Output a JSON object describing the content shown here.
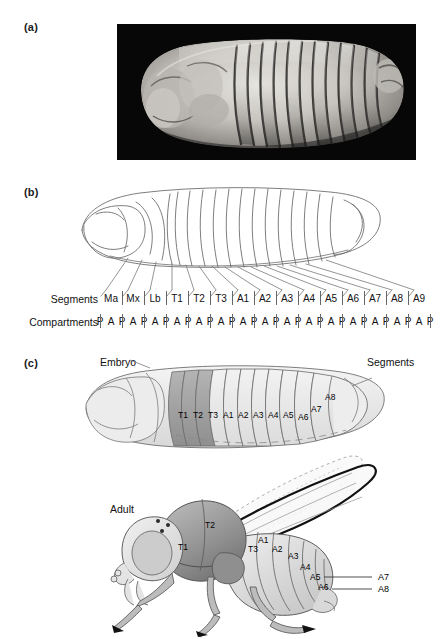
{
  "figure": {
    "panels": [
      {
        "id": "a",
        "label": "(a)",
        "kind": "micrograph",
        "caption_text": ""
      },
      {
        "id": "b",
        "label": "(b)",
        "kind": "line-diagram",
        "caption_text": ""
      },
      {
        "id": "c",
        "label": "(c)",
        "kind": "shaded-diagram",
        "caption_text": ""
      }
    ]
  },
  "panel_a": {
    "label": "(a)",
    "image_name": "drosophila-embryo-scanning-electron-micrograph"
  },
  "panel_b": {
    "label": "(b)",
    "diagram_name": "segmented-embryo-line-drawing",
    "row_labels": {
      "segments": "Segments",
      "compartments": "Compartments"
    },
    "segments": [
      "Ma",
      "Mx",
      "Lb",
      "T1",
      "T2",
      "T3",
      "A1",
      "A2",
      "A3",
      "A4",
      "A5",
      "A6",
      "A7",
      "A8",
      "A9"
    ],
    "compartments": [
      "P",
      "A",
      "P",
      "A",
      "P",
      "A",
      "P",
      "A",
      "P",
      "A",
      "P",
      "A",
      "P",
      "A",
      "P",
      "A",
      "P",
      "A",
      "P",
      "A",
      "P",
      "A",
      "P",
      "A",
      "P",
      "A",
      "P",
      "A",
      "P",
      "A",
      "P"
    ]
  },
  "panel_c": {
    "label": "(c)",
    "embryo_label": "Embryo",
    "segments_label": "Segments",
    "adult_label": "Adult",
    "embryo_diagram_name": "shaded-embryo-segment-map",
    "adult_diagram_name": "adult-fly-segment-map",
    "embryo_segment_tags": [
      "T1",
      "T2",
      "T3",
      "A1",
      "A2",
      "A3",
      "A4",
      "A5",
      "A6",
      "A7",
      "A8"
    ],
    "adult_segment_tags": [
      "T1",
      "T2",
      "T3",
      "A1",
      "A2",
      "A3",
      "A4",
      "A5",
      "A6"
    ],
    "adult_leader_tags": [
      "A7",
      "A8"
    ]
  },
  "colors": {
    "background": "#ffffff",
    "text": "#111111",
    "micrograph_bg": "#0a0a0a",
    "line_stroke": "#6b6b6b",
    "thorax_shade": "#a9a9a9",
    "abdomen_shade": "#e3e3e3",
    "head_shade": "#efefef",
    "fly_dark": "#9a9a9a",
    "fly_light": "#d6d6d6",
    "tick_stroke": "#666666"
  }
}
